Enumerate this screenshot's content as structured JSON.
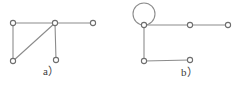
{
  "figure": {
    "background_color": "#ffffff",
    "edge_color": "#8c8c8c",
    "node_stroke_color": "#6e6e6e",
    "node_fill_color": "#ffffff",
    "caption_color": "#3a3a3a",
    "node_radius": 2.6,
    "edge_width": 1.1,
    "loop_radius": 11
  },
  "panels": [
    {
      "id": "a",
      "caption": "a）",
      "caption_plain": "a)",
      "nodes": [
        {
          "id": "a-top-left",
          "x": 13,
          "y": 23
        },
        {
          "id": "a-hub",
          "x": 55,
          "y": 23
        },
        {
          "id": "a-top-right",
          "x": 93,
          "y": 23
        },
        {
          "id": "a-bottom-left",
          "x": 13,
          "y": 61
        },
        {
          "id": "a-bottom-middle",
          "x": 56,
          "y": 60
        }
      ],
      "edges": [
        {
          "id": "a-edge-top",
          "from": "a-top-left",
          "to": "a-hub"
        },
        {
          "id": "a-edge-right",
          "from": "a-hub",
          "to": "a-top-right"
        },
        {
          "id": "a-edge-left",
          "from": "a-top-left",
          "to": "a-bottom-left"
        },
        {
          "id": "a-edge-diagonal",
          "from": "a-bottom-left",
          "to": "a-hub"
        },
        {
          "id": "a-edge-stem",
          "from": "a-hub",
          "to": "a-bottom-middle"
        }
      ],
      "loops": []
    },
    {
      "id": "b",
      "caption": "b）",
      "caption_plain": "b)",
      "nodes": [
        {
          "id": "b-loop-node",
          "x": 144,
          "y": 25
        },
        {
          "id": "b-top-middle",
          "x": 190,
          "y": 25
        },
        {
          "id": "b-top-right",
          "x": 228,
          "y": 25
        },
        {
          "id": "b-bottom-left",
          "x": 144,
          "y": 61
        },
        {
          "id": "b-bottom-right",
          "x": 190,
          "y": 60
        }
      ],
      "edges": [
        {
          "id": "b-edge-top-left",
          "from": "b-loop-node",
          "to": "b-top-middle"
        },
        {
          "id": "b-edge-top-right",
          "from": "b-top-middle",
          "to": "b-top-right"
        },
        {
          "id": "b-edge-vertical",
          "from": "b-loop-node",
          "to": "b-bottom-left"
        },
        {
          "id": "b-edge-bottom",
          "from": "b-bottom-left",
          "to": "b-bottom-right"
        }
      ],
      "loops": [
        {
          "id": "b-self-loop",
          "at": "b-loop-node",
          "cx": 144,
          "cy": 14,
          "r": 11
        }
      ]
    }
  ]
}
